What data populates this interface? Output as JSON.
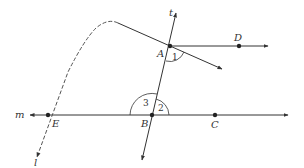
{
  "diagram": {
    "type": "geometry",
    "colors": {
      "line": "#333333",
      "background": "#ffffff"
    },
    "points": [
      {
        "name": "A",
        "x": 170,
        "y": 46,
        "label": "A"
      },
      {
        "name": "B",
        "x": 152,
        "y": 115,
        "label": "B"
      },
      {
        "name": "C",
        "x": 215,
        "y": 115,
        "label": "C"
      },
      {
        "name": "D",
        "x": 239,
        "y": 46,
        "label": "D"
      },
      {
        "name": "E",
        "x": 48,
        "y": 115,
        "label": "E"
      }
    ],
    "lines": {
      "t": {
        "label": "t"
      },
      "m": {
        "label": "m"
      },
      "l": {
        "label": "l"
      }
    },
    "angles": [
      {
        "id": "1",
        "label": "1",
        "vertex": "A"
      },
      {
        "id": "2",
        "label": "2",
        "vertex": "B"
      },
      {
        "id": "3",
        "label": "3",
        "vertex": "B"
      }
    ]
  }
}
